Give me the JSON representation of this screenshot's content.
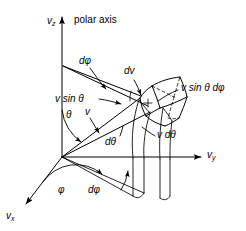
{
  "figure": {
    "name": "velocity-space-volume-element",
    "background": "#ffffff",
    "stroke": "#000000",
    "width": 246,
    "height": 231
  },
  "axes": [
    {
      "id": "vz",
      "label_main": "v",
      "label_sub": "z",
      "annotation": "polar axis"
    },
    {
      "id": "vy",
      "label_main": "v",
      "label_sub": "y",
      "annotation": ""
    },
    {
      "id": "vx",
      "label_main": "v",
      "label_sub": "x",
      "annotation": ""
    }
  ],
  "labels": {
    "polar_axis": "polar axis",
    "d_phi_upper": "dφ",
    "d_phi_lower": "dφ",
    "v_sin_theta": "v sin θ",
    "v_sin_theta_d_phi": "v sin θ dφ",
    "dv": "dv",
    "theta": "θ",
    "phi": "φ",
    "v": "v",
    "d_theta": "dθ",
    "v_d_theta": "v dθ"
  }
}
